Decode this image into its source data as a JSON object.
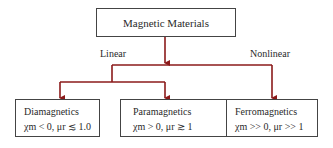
{
  "diagram": {
    "root": {
      "label": "Magnetic Materials"
    },
    "branches": {
      "linear": "Linear",
      "nonlinear": "Nonlinear"
    },
    "leaves": [
      {
        "name": "Diamagnetics",
        "formula": "χm < 0, μr ≲ 1.0"
      },
      {
        "name": "Paramagnetics",
        "formula": "χm > 0, μr ≳ 1"
      },
      {
        "name": "Ferromagnetics",
        "formula": "χm >> 0, μr >> 1"
      }
    ],
    "colors": {
      "connector": "#8b1a1a",
      "box_border": "#444444",
      "text": "#2a2a2a"
    }
  }
}
